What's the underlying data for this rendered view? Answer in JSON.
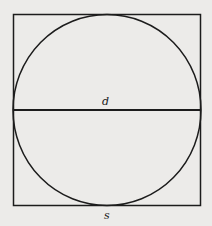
{
  "diagram": {
    "shapes": {
      "square": {
        "x": 13,
        "y": 14,
        "width": 188,
        "height": 192,
        "stroke": "#1c1c1c",
        "stroke_width": 1.5
      },
      "circle": {
        "cx": 107,
        "cy": 110,
        "r": 94,
        "stroke": "#1c1c1c",
        "stroke_width": 1.5
      },
      "diameter": {
        "x1": 13,
        "y1": 110,
        "x2": 201,
        "y2": 110,
        "stroke": "#1c1c1c",
        "stroke_width": 1.8
      }
    },
    "labels": {
      "diameter": "d",
      "side": "s"
    },
    "colors": {
      "background": "#ecebe9",
      "line": "#1c1c1c"
    }
  }
}
